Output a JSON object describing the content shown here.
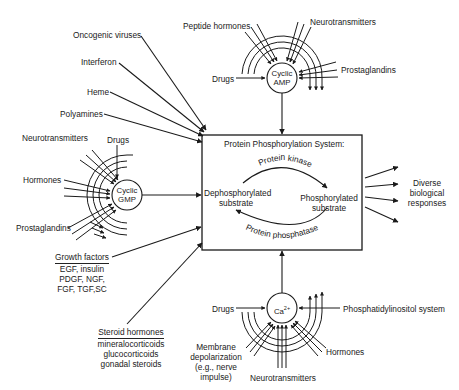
{
  "diagram": {
    "central_box": {
      "title": "Protein Phosphorylation System:",
      "left_state": [
        "Dephosphorylated",
        "substrate"
      ],
      "right_state": [
        "Phosphorylated",
        "substrate"
      ],
      "forward_enzyme": "Protein kinase",
      "reverse_enzyme": "Protein phosphatase"
    },
    "outputs": {
      "label": [
        "Diverse",
        "biological",
        "responses"
      ],
      "arrow_count": 4
    },
    "direct_inputs": [
      "Oncogenic viruses",
      "Interferon",
      "Heme",
      "Polyamines"
    ],
    "cyclic_amp": {
      "node": [
        "Cyclic",
        "AMP"
      ],
      "inputs": [
        "Peptide hormones",
        "Neurotransmitters",
        "Drugs",
        "Prostaglandins"
      ]
    },
    "cyclic_gmp": {
      "node": [
        "Cyclic",
        "GMP"
      ],
      "inputs": [
        "Neurotransmitters",
        "Drugs",
        "Hormones",
        "Prostaglandins"
      ]
    },
    "calcium": {
      "node": "Ca",
      "superscript": "2+",
      "inputs": [
        "Drugs",
        "Phosphatidylinositol system",
        "Hormones",
        "Neurotransmitters"
      ],
      "membrane": [
        "Membrane",
        "depolarization",
        "(e.g., nerve",
        "impulse)"
      ]
    },
    "growth_factors": {
      "heading": "Growth factors",
      "items": [
        "EGF, insulin",
        "PDGF, NGF,",
        "FGF, TGF,SC"
      ]
    },
    "steroid_hormones": {
      "heading": "Steroid hormones",
      "items": [
        "mineralocorticoids",
        "glucocorticoids",
        "gonadal steroids"
      ]
    }
  }
}
